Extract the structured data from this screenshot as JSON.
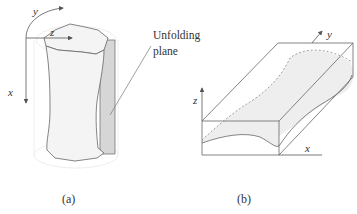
{
  "figure": {
    "panel_a": {
      "caption": "(a)",
      "axis_labels": {
        "x": "x",
        "y": "y",
        "z": "z"
      },
      "callout": {
        "line1": "Unfolding",
        "line2": "plane"
      }
    },
    "panel_b": {
      "caption": "(b)",
      "axis_labels": {
        "x": "x",
        "y": "y",
        "z": "z"
      }
    }
  },
  "colors": {
    "line": "#555555",
    "body_fill": "#f4f4f4",
    "plane_fill": "#d6d6d6",
    "halo": "#eeeeee"
  }
}
